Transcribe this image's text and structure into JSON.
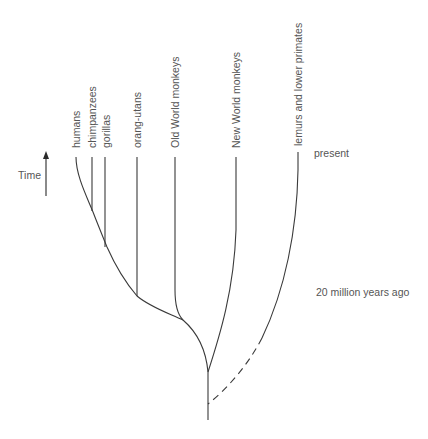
{
  "diagram": {
    "type": "phylogenetic-tree",
    "time_axis": {
      "label": "Time",
      "direction": "up"
    },
    "time_markers": {
      "present": "present",
      "past": "20 million years ago"
    },
    "taxa": [
      {
        "id": "humans",
        "label": "humans"
      },
      {
        "id": "chimpanzees",
        "label": "chimpanzees"
      },
      {
        "id": "gorillas",
        "label": "gorillas"
      },
      {
        "id": "orang-utans",
        "label": "orang-utans"
      },
      {
        "id": "old-world-monkeys",
        "label": "Old World monkeys"
      },
      {
        "id": "new-world-monkeys",
        "label": "New World monkeys"
      },
      {
        "id": "lemurs",
        "label": "lemurs and lower primates"
      }
    ],
    "colors": {
      "line": "#3a3a3a",
      "text": "#555555",
      "background": "#ffffff"
    }
  }
}
